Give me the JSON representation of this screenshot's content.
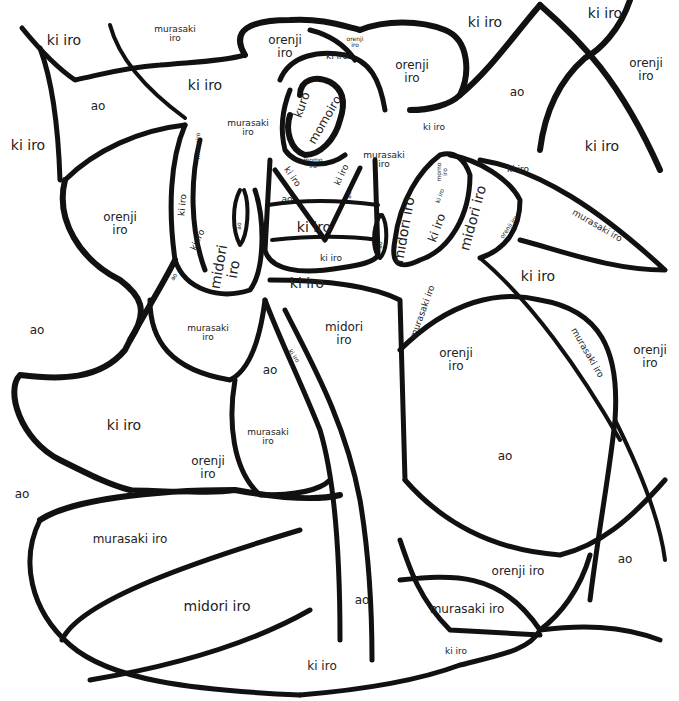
{
  "page": {
    "type": "color-by-word coloring page"
  },
  "color_key": {
    "ki_iro": "#f2d21b",
    "ao": "#2a6fdb",
    "orenji_iro": "#f28a1b",
    "murasaki_iro": "#7a3fb0",
    "midori_iro": "#2fa24a",
    "momoiro": "#f39ab8",
    "kuro": "#111111"
  },
  "labels": [
    {
      "id": "ki-top-left",
      "lines": [
        "ki iro"
      ]
    },
    {
      "id": "murasaki-top-left",
      "lines": [
        "murasaki",
        "iro"
      ]
    },
    {
      "id": "ki-upper-mid-left",
      "lines": [
        "ki iro"
      ]
    },
    {
      "id": "ao-upper-left",
      "lines": [
        "ao"
      ]
    },
    {
      "id": "ki-left-edge",
      "lines": [
        "ki iro"
      ]
    },
    {
      "id": "orenji-hair-left",
      "lines": [
        "orenji",
        "iro"
      ]
    },
    {
      "id": "orenji-hair-tiny",
      "lines": [
        "orenji",
        "iro"
      ]
    },
    {
      "id": "ki-hair-band",
      "lines": [
        "ki iro"
      ]
    },
    {
      "id": "orenji-hair-right",
      "lines": [
        "orenji",
        "iro"
      ]
    },
    {
      "id": "ki-top-center",
      "lines": [
        "ki iro"
      ]
    },
    {
      "id": "ki-top-right",
      "lines": [
        "ki iro"
      ]
    },
    {
      "id": "orenji-top-right",
      "lines": [
        "orenji",
        "iro"
      ]
    },
    {
      "id": "ao-top-right",
      "lines": [
        "ao"
      ]
    },
    {
      "id": "ki-right-upper",
      "lines": [
        "ki iro"
      ]
    },
    {
      "id": "kuro-hair",
      "lines": [
        "kuro"
      ]
    },
    {
      "id": "momoiro-face",
      "lines": [
        "momoiro"
      ]
    },
    {
      "id": "murasaki-near-face-left",
      "lines": [
        "murasaki",
        "iro"
      ]
    },
    {
      "id": "ki-near-face-right",
      "lines": [
        "ki iro"
      ]
    },
    {
      "id": "murasaki-near-face-right",
      "lines": [
        "murasaki",
        "iro"
      ]
    },
    {
      "id": "momoiro-left-hand",
      "lines": [
        "momoiro"
      ]
    },
    {
      "id": "momo-neck",
      "lines": [
        "momo",
        "iro"
      ]
    },
    {
      "id": "ki-collar-left",
      "lines": [
        "ki iro"
      ]
    },
    {
      "id": "ki-collar-right",
      "lines": [
        "ki iro"
      ]
    },
    {
      "id": "ao-chest-left",
      "lines": [
        "ao"
      ]
    },
    {
      "id": "ao-chest-right",
      "lines": [
        "ao"
      ]
    },
    {
      "id": "ki-obi",
      "lines": [
        "ki iro"
      ]
    },
    {
      "id": "ki-obi-lower",
      "lines": [
        "ki iro"
      ]
    },
    {
      "id": "ki-below-obi",
      "lines": [
        "ki iro"
      ]
    },
    {
      "id": "orenji-left-big",
      "lines": [
        "orenji",
        "iro"
      ]
    },
    {
      "id": "ki-left-sleeve-a",
      "lines": [
        "ki iro"
      ]
    },
    {
      "id": "ki-left-sleeve-b",
      "lines": [
        "ki iro"
      ]
    },
    {
      "id": "ao-left-sleeve-tip",
      "lines": [
        "ao"
      ]
    },
    {
      "id": "ao-left-sleeve-small",
      "lines": [
        "ao"
      ]
    },
    {
      "id": "midori-left-sleeve",
      "lines": [
        "midori",
        "iro"
      ]
    },
    {
      "id": "momo-right-hand",
      "lines": [
        "momo",
        "iro"
      ]
    },
    {
      "id": "ki-right-hand",
      "lines": [
        "ki iro"
      ]
    },
    {
      "id": "ki-right-sleeve",
      "lines": [
        "ki iro"
      ]
    },
    {
      "id": "midori-right-sleeve-a",
      "lines": [
        "midori iro"
      ]
    },
    {
      "id": "midori-right-sleeve-b",
      "lines": [
        "midori iro"
      ]
    },
    {
      "id": "ao-right-sleeve",
      "lines": [
        "ao"
      ]
    },
    {
      "id": "orenji-right-sleeve",
      "lines": [
        "orenji iro"
      ]
    },
    {
      "id": "ki-right-mid",
      "lines": [
        "ki iro"
      ]
    },
    {
      "id": "murasaki-right-wing",
      "lines": [
        "murasaki iro"
      ]
    },
    {
      "id": "ki-right-top-mid",
      "lines": [
        "ki iro"
      ]
    },
    {
      "id": "ao-left-mid",
      "lines": [
        "ao"
      ]
    },
    {
      "id": "murasaki-left-body",
      "lines": [
        "murasaki",
        "iro"
      ]
    },
    {
      "id": "midori-center-robe",
      "lines": [
        "midori",
        "iro"
      ]
    },
    {
      "id": "ki-robe-strip",
      "lines": [
        "ki iro"
      ]
    },
    {
      "id": "murasaki-robe-right-strip",
      "lines": [
        "murasaki iro"
      ]
    },
    {
      "id": "orenji-right-mid",
      "lines": [
        "orenji",
        "iro"
      ]
    },
    {
      "id": "murasaki-right-diag",
      "lines": [
        "murasaki iro"
      ]
    },
    {
      "id": "orenji-far-right",
      "lines": [
        "orenji",
        "iro"
      ]
    },
    {
      "id": "ao-robe-left",
      "lines": [
        "ao"
      ]
    },
    {
      "id": "ki-left-lower",
      "lines": [
        "ki iro"
      ]
    },
    {
      "id": "murasaki-robe-lower-left",
      "lines": [
        "murasaki",
        "iro"
      ]
    },
    {
      "id": "orenji-lower-left",
      "lines": [
        "orenji",
        "iro"
      ]
    },
    {
      "id": "ao-far-left-lower",
      "lines": [
        "ao"
      ]
    },
    {
      "id": "ao-right-big",
      "lines": [
        "ao"
      ]
    },
    {
      "id": "murasaki-bottom-left",
      "lines": [
        "murasaki iro"
      ]
    },
    {
      "id": "midori-bottom-left",
      "lines": [
        "midori iro"
      ]
    },
    {
      "id": "ao-bottom-center",
      "lines": [
        "ao"
      ]
    },
    {
      "id": "orenji-bottom-right",
      "lines": [
        "orenji iro"
      ]
    },
    {
      "id": "ao-bottom-right",
      "lines": [
        "ao"
      ]
    },
    {
      "id": "murasaki-bottom-right",
      "lines": [
        "murasaki iro"
      ]
    },
    {
      "id": "ki-bottom-right",
      "lines": [
        "ki iro"
      ]
    },
    {
      "id": "ki-bottom-center",
      "lines": [
        "ki iro"
      ]
    }
  ]
}
